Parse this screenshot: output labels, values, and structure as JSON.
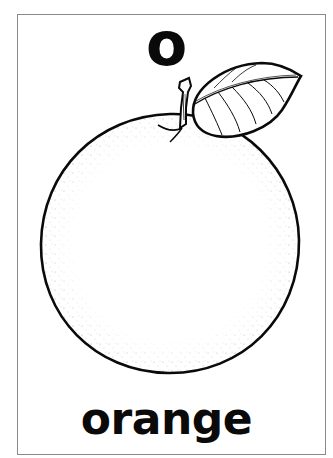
{
  "card": {
    "letter": "o",
    "word": "orange",
    "illustration": "orange-fruit-with-stem-and-leaf",
    "colors": {
      "ink": "#0a0a0a",
      "background": "#ffffff",
      "border": "#8a8a8a"
    }
  }
}
